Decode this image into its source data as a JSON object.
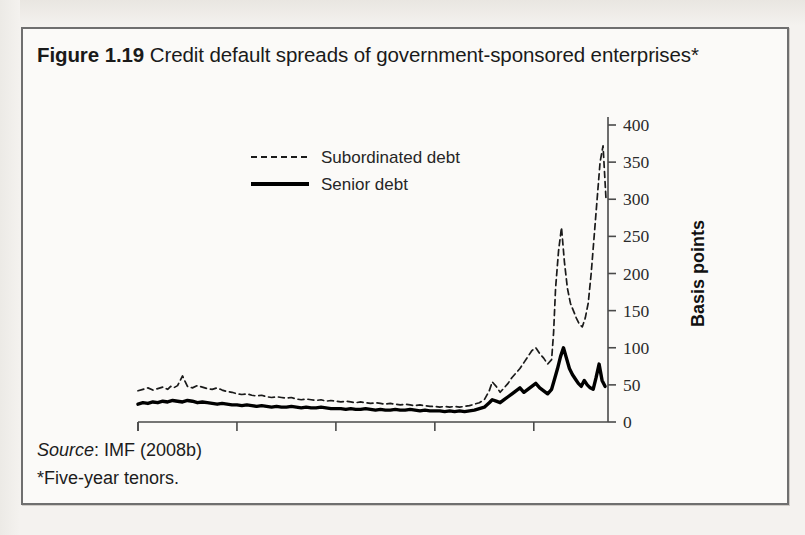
{
  "figure": {
    "number": "Figure 1.19",
    "title": "Credit default spreads of government-sponsored enterprises*",
    "source_label": "Source",
    "source_text": ": IMF (2008b)",
    "footnote": "*Five-year tenors."
  },
  "chart_data": {
    "type": "line",
    "title": "Credit default spreads of government-sponsored enterprises*",
    "xlabel": "",
    "ylabel": "Basis points",
    "xlim": [
      2004.0,
      2008.75
    ],
    "ylim": [
      0,
      400
    ],
    "yticks": [
      0,
      50,
      100,
      150,
      200,
      250,
      300,
      350,
      400
    ],
    "xticks": [
      2004,
      2005,
      2006,
      2007,
      2008
    ],
    "xtick_labels": [
      "2004",
      "2005",
      "2006",
      "2007",
      "2008"
    ],
    "grid": false,
    "legend_position": "upper-left-inside",
    "y_axis_side": "right",
    "series": [
      {
        "name": "Subordinated debt",
        "style": "dashed",
        "color": "#1a1a1a",
        "x": [
          2004.0,
          2004.05,
          2004.1,
          2004.15,
          2004.2,
          2004.25,
          2004.3,
          2004.33,
          2004.36,
          2004.4,
          2004.45,
          2004.5,
          2004.55,
          2004.6,
          2004.65,
          2004.7,
          2004.75,
          2004.8,
          2004.85,
          2004.9,
          2004.95,
          2005.0,
          2005.05,
          2005.1,
          2005.15,
          2005.2,
          2005.25,
          2005.3,
          2005.35,
          2005.4,
          2005.45,
          2005.5,
          2005.55,
          2005.6,
          2005.65,
          2005.7,
          2005.75,
          2005.8,
          2005.85,
          2005.9,
          2005.95,
          2006.0,
          2006.05,
          2006.1,
          2006.15,
          2006.2,
          2006.25,
          2006.3,
          2006.35,
          2006.4,
          2006.45,
          2006.5,
          2006.55,
          2006.6,
          2006.65,
          2006.7,
          2006.75,
          2006.8,
          2006.85,
          2006.9,
          2006.95,
          2007.0,
          2007.05,
          2007.1,
          2007.15,
          2007.2,
          2007.25,
          2007.3,
          2007.35,
          2007.4,
          2007.45,
          2007.5,
          2007.55,
          2007.58,
          2007.62,
          2007.66,
          2007.7,
          2007.74,
          2007.78,
          2007.82,
          2007.86,
          2007.9,
          2007.94,
          2007.98,
          2008.02,
          2008.06,
          2008.1,
          2008.14,
          2008.18,
          2008.2,
          2008.22,
          2008.25,
          2008.28,
          2008.31,
          2008.34,
          2008.37,
          2008.4,
          2008.43,
          2008.46,
          2008.49,
          2008.52,
          2008.55,
          2008.58,
          2008.61,
          2008.64,
          2008.67,
          2008.7,
          2008.73
        ],
        "y": [
          42,
          44,
          46,
          43,
          45,
          47,
          44,
          48,
          46,
          49,
          62,
          48,
          46,
          49,
          47,
          45,
          44,
          46,
          43,
          41,
          40,
          38,
          37,
          38,
          36,
          35,
          36,
          34,
          33,
          34,
          33,
          32,
          33,
          31,
          30,
          31,
          30,
          29,
          30,
          28,
          29,
          28,
          27,
          28,
          27,
          26,
          27,
          26,
          25,
          26,
          25,
          24,
          25,
          24,
          23,
          24,
          23,
          22,
          23,
          22,
          21,
          21,
          20,
          21,
          20,
          21,
          20,
          21,
          22,
          24,
          26,
          30,
          42,
          54,
          48,
          40,
          46,
          52,
          60,
          66,
          72,
          80,
          88,
          96,
          100,
          92,
          86,
          78,
          84,
          120,
          180,
          230,
          262,
          215,
          180,
          160,
          150,
          140,
          132,
          128,
          140,
          160,
          200,
          250,
          300,
          350,
          372,
          300
        ],
        "note": "Dashed line; stays near 20-50 bps through 2004-mid2007, spikes to ~262 in early 2008 and ~372 at far right."
      },
      {
        "name": "Senior debt",
        "style": "solid",
        "color": "#000000",
        "x": [
          2004.0,
          2004.05,
          2004.1,
          2004.15,
          2004.2,
          2004.25,
          2004.3,
          2004.35,
          2004.4,
          2004.45,
          2004.5,
          2004.55,
          2004.6,
          2004.65,
          2004.7,
          2004.75,
          2004.8,
          2004.85,
          2004.9,
          2004.95,
          2005.0,
          2005.05,
          2005.1,
          2005.15,
          2005.2,
          2005.25,
          2005.3,
          2005.35,
          2005.4,
          2005.45,
          2005.5,
          2005.55,
          2005.6,
          2005.65,
          2005.7,
          2005.75,
          2005.8,
          2005.85,
          2005.9,
          2005.95,
          2006.0,
          2006.05,
          2006.1,
          2006.15,
          2006.2,
          2006.25,
          2006.3,
          2006.35,
          2006.4,
          2006.45,
          2006.5,
          2006.55,
          2006.6,
          2006.65,
          2006.7,
          2006.75,
          2006.8,
          2006.85,
          2006.9,
          2006.95,
          2007.0,
          2007.05,
          2007.1,
          2007.15,
          2007.2,
          2007.25,
          2007.3,
          2007.35,
          2007.4,
          2007.45,
          2007.5,
          2007.55,
          2007.58,
          2007.62,
          2007.66,
          2007.7,
          2007.74,
          2007.78,
          2007.82,
          2007.86,
          2007.9,
          2007.94,
          2007.98,
          2008.02,
          2008.06,
          2008.1,
          2008.14,
          2008.18,
          2008.21,
          2008.24,
          2008.27,
          2008.3,
          2008.33,
          2008.36,
          2008.39,
          2008.42,
          2008.45,
          2008.48,
          2008.51,
          2008.54,
          2008.57,
          2008.6,
          2008.63,
          2008.66,
          2008.69,
          2008.72
        ],
        "y": [
          24,
          26,
          25,
          27,
          26,
          28,
          27,
          29,
          28,
          27,
          29,
          28,
          26,
          27,
          26,
          25,
          24,
          25,
          24,
          23,
          23,
          22,
          23,
          22,
          21,
          22,
          21,
          20,
          21,
          20,
          20,
          21,
          20,
          19,
          20,
          19,
          19,
          20,
          19,
          18,
          18,
          18,
          17,
          18,
          17,
          17,
          18,
          17,
          16,
          17,
          16,
          16,
          17,
          16,
          16,
          17,
          16,
          15,
          16,
          15,
          15,
          15,
          14,
          15,
          14,
          15,
          14,
          15,
          16,
          18,
          20,
          26,
          30,
          28,
          26,
          30,
          34,
          38,
          42,
          46,
          40,
          44,
          48,
          52,
          46,
          42,
          38,
          44,
          58,
          72,
          88,
          100,
          86,
          72,
          64,
          58,
          52,
          48,
          56,
          50,
          46,
          44,
          60,
          78,
          56,
          48
        ],
        "note": "Thick solid line; hovers 15-30 bps through 2004-mid2007, peaks ~100 in early 2008, secondary peak ~78 near right edge."
      }
    ]
  },
  "legend": {
    "items": [
      {
        "label": "Subordinated debt",
        "style": "dashed"
      },
      {
        "label": "Senior debt",
        "style": "solid"
      }
    ]
  }
}
